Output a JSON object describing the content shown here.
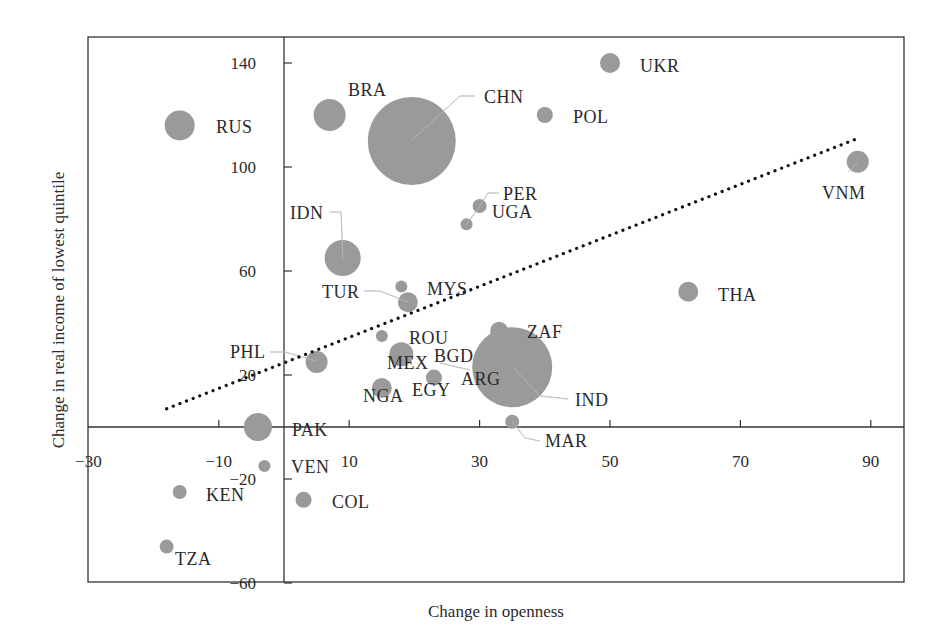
{
  "chart_data": {
    "type": "scatter",
    "subtype": "bubble",
    "title": "",
    "xlabel": "Change in openness",
    "ylabel": "Change in real income of lowest quintile",
    "xlim": [
      -30,
      95
    ],
    "ylim": [
      -60,
      150
    ],
    "x_ticks": [
      -30,
      -10,
      10,
      30,
      50,
      70,
      90
    ],
    "y_ticks": [
      -60,
      -20,
      20,
      60,
      100,
      140
    ],
    "grid": false,
    "legend": null,
    "bubble_color": "#9a9a9a",
    "points": [
      {
        "label": "RUS",
        "x": -16,
        "y": 116,
        "size": 15
      },
      {
        "label": "BRA",
        "x": 7,
        "y": 120,
        "size": 16
      },
      {
        "label": "CHN",
        "x": 19.6,
        "y": 110,
        "size": 44
      },
      {
        "label": "UKR",
        "x": 50,
        "y": 140,
        "size": 10
      },
      {
        "label": "POL",
        "x": 40,
        "y": 120,
        "size": 8
      },
      {
        "label": "PER",
        "x": 30,
        "y": 85,
        "size": 7
      },
      {
        "label": "UGA",
        "x": 28,
        "y": 78,
        "size": 6
      },
      {
        "label": "IDN",
        "x": 9,
        "y": 65,
        "size": 18
      },
      {
        "label": "VNM",
        "x": 88,
        "y": 102,
        "size": 11
      },
      {
        "label": "MYS",
        "x": 18,
        "y": 54,
        "size": 6
      },
      {
        "label": "TUR",
        "x": 19,
        "y": 48,
        "size": 10
      },
      {
        "label": "THA",
        "x": 62,
        "y": 52,
        "size": 10
      },
      {
        "label": "ROU",
        "x": 15,
        "y": 35,
        "size": 6
      },
      {
        "label": "MEX",
        "x": 18,
        "y": 28,
        "size": 12
      },
      {
        "label": "ZAF",
        "x": 33,
        "y": 37,
        "size": 9
      },
      {
        "label": "IND",
        "x": 35,
        "y": 23,
        "size": 40
      },
      {
        "label": "BGD",
        "x": 34,
        "y": 24,
        "size": 0
      },
      {
        "label": "ARG",
        "x": 34,
        "y": 22,
        "size": 0
      },
      {
        "label": "PHL",
        "x": 5,
        "y": 25,
        "size": 11
      },
      {
        "label": "EGY",
        "x": 23,
        "y": 19,
        "size": 8
      },
      {
        "label": "NGA",
        "x": 15,
        "y": 15,
        "size": 10
      },
      {
        "label": "PAK",
        "x": -4,
        "y": 0,
        "size": 14
      },
      {
        "label": "MAR",
        "x": 35,
        "y": 2,
        "size": 7
      },
      {
        "label": "VEN",
        "x": -3,
        "y": -15,
        "size": 6
      },
      {
        "label": "COL",
        "x": 3,
        "y": -28,
        "size": 8
      },
      {
        "label": "KEN",
        "x": -16,
        "y": -25,
        "size": 7
      },
      {
        "label": "TZA",
        "x": -18,
        "y": -46,
        "size": 7
      }
    ],
    "trendline": {
      "style": "dotted",
      "color": "#111111",
      "x": [
        -18,
        88
      ],
      "y": [
        7,
        111
      ]
    }
  },
  "labels": [
    {
      "text": "RUS",
      "lx": 216,
      "ly": 133
    },
    {
      "text": "BRA",
      "lx": 348,
      "ly": 96
    },
    {
      "text": "CHN",
      "lx": 484,
      "ly": 103,
      "leader": [
        [
          475,
          96
        ],
        [
          460,
          96
        ],
        [
          412,
          140
        ]
      ]
    },
    {
      "text": "UKR",
      "lx": 640,
      "ly": 72
    },
    {
      "text": "POL",
      "lx": 573,
      "ly": 123
    },
    {
      "text": "PER",
      "lx": 503,
      "ly": 200,
      "leader": [
        [
          499,
          193
        ],
        [
          488,
          193
        ],
        [
          480,
          206
        ]
      ]
    },
    {
      "text": "UGA",
      "lx": 492,
      "ly": 218,
      "leader": [
        [
          480,
          206
        ],
        [
          466,
          225
        ]
      ]
    },
    {
      "text": "IDN",
      "lx": 290,
      "ly": 219,
      "leader": [
        [
          330,
          212
        ],
        [
          341,
          212
        ],
        [
          343,
          258
        ]
      ]
    },
    {
      "text": "VNM",
      "lx": 822,
      "ly": 199,
      "leader": [
        [
          858,
          162
        ],
        [
          848,
          172
        ]
      ]
    },
    {
      "text": "MYS",
      "lx": 427,
      "ly": 295
    },
    {
      "text": "TUR",
      "lx": 322,
      "ly": 298,
      "leader": [
        [
          364,
          291
        ],
        [
          380,
          291
        ],
        [
          408,
          302
        ]
      ]
    },
    {
      "text": "THA",
      "lx": 718,
      "ly": 301
    },
    {
      "text": "ROU",
      "lx": 409,
      "ly": 344
    },
    {
      "text": "MEX",
      "lx": 387,
      "ly": 369
    },
    {
      "text": "BGD",
      "lx": 434,
      "ly": 362,
      "leader": [
        [
          440,
          363
        ],
        [
          470,
          370
        ]
      ]
    },
    {
      "text": "ZAF",
      "lx": 527,
      "ly": 338
    },
    {
      "text": "ARG",
      "lx": 461,
      "ly": 385
    },
    {
      "text": "IND",
      "lx": 575,
      "ly": 406,
      "leader": [
        [
          513,
          367
        ],
        [
          540,
          396
        ],
        [
          568,
          399
        ]
      ]
    },
    {
      "text": "PHL",
      "lx": 230,
      "ly": 358,
      "leader": [
        [
          270,
          352
        ],
        [
          285,
          352
        ],
        [
          316,
          361
        ]
      ]
    },
    {
      "text": "EGY",
      "lx": 412,
      "ly": 396
    },
    {
      "text": "NGA",
      "lx": 363,
      "ly": 402
    },
    {
      "text": "PAK",
      "lx": 292,
      "ly": 436
    },
    {
      "text": "MAR",
      "lx": 545,
      "ly": 447,
      "leader": [
        [
          512,
          421
        ],
        [
          525,
          438
        ],
        [
          540,
          441
        ]
      ]
    },
    {
      "text": "VEN",
      "lx": 291,
      "ly": 473
    },
    {
      "text": "COL",
      "lx": 332,
      "ly": 508
    },
    {
      "text": "KEN",
      "lx": 206,
      "ly": 501
    },
    {
      "text": "TZA",
      "lx": 175,
      "ly": 565
    }
  ]
}
